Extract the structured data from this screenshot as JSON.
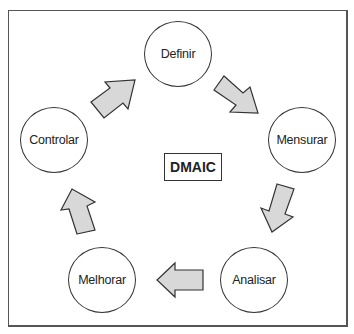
{
  "diagram": {
    "title": "DMAIC",
    "type": "cycle",
    "nodes": [
      {
        "id": "definir",
        "label": "Definir"
      },
      {
        "id": "mensurar",
        "label": "Mensurar"
      },
      {
        "id": "analisar",
        "label": "Analisar"
      },
      {
        "id": "melhorar",
        "label": "Melhorar"
      },
      {
        "id": "controlar",
        "label": "Controlar"
      }
    ],
    "edges": [
      {
        "from": "definir",
        "to": "mensurar"
      },
      {
        "from": "mensurar",
        "to": "analisar"
      },
      {
        "from": "analisar",
        "to": "melhorar"
      },
      {
        "from": "melhorar",
        "to": "controlar"
      },
      {
        "from": "controlar",
        "to": "definir"
      }
    ],
    "colors": {
      "arrow_fill": "#d8d8d8",
      "arrow_stroke": "#333333",
      "node_stroke": "#333333",
      "frame_stroke": "#555555"
    }
  }
}
